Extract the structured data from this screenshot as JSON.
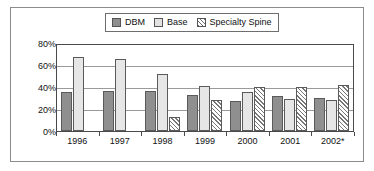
{
  "chart_data": {
    "type": "bar",
    "title": "",
    "xlabel": "",
    "ylabel": "",
    "categories": [
      "1996",
      "1997",
      "1998",
      "1999",
      "2000",
      "2001",
      "2002*"
    ],
    "series": [
      {
        "name": "DBM",
        "values": [
          35,
          36,
          36,
          33,
          27,
          32,
          30
        ],
        "color": "#8f8f8f",
        "fill": "solid-gray"
      },
      {
        "name": "Base",
        "values": [
          67,
          65,
          52,
          41,
          35,
          29,
          28
        ],
        "color": "#e6e6e6",
        "fill": "light-gray"
      },
      {
        "name": "Specialty Spine",
        "values": [
          null,
          null,
          13,
          28,
          40,
          40,
          42
        ],
        "color": "#ffffff",
        "fill": "diagonal-hatch"
      }
    ],
    "ylim": [
      0,
      80
    ],
    "yticks": [
      0,
      20,
      40,
      60,
      80
    ],
    "ytick_labels": [
      "0%",
      "20%",
      "40%",
      "60%",
      "80%"
    ],
    "grid": true,
    "legend_position": "top-center"
  },
  "legend": {
    "entries": [
      {
        "label": "DBM",
        "swatch": "solid-gray-swatch"
      },
      {
        "label": "Base",
        "swatch": "light-gray-swatch"
      },
      {
        "label": "Specialty Spine",
        "swatch": "hatched-swatch"
      }
    ]
  },
  "axis": {
    "y_labels": [
      "80%",
      "60%",
      "40%",
      "20%",
      "0%"
    ],
    "x_labels": [
      "1996",
      "1997",
      "1998",
      "1999",
      "2000",
      "2001",
      "2002*"
    ]
  },
  "colors": {
    "dbm": "#8f8f8f",
    "base": "#e6e6e6",
    "specialty_spine": "#ffffff",
    "axis": "#4a4a4a",
    "grid": "#9a9a9a",
    "frame": "#8c8c8c",
    "text": "#111111"
  }
}
